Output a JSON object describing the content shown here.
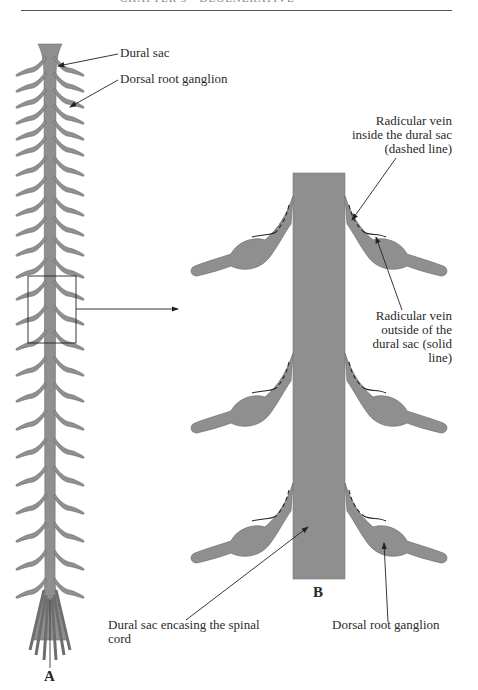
{
  "page": {
    "header_text": "CHAPTER 5 · DEGENERATIVE"
  },
  "panel_a": {
    "letter": "A",
    "labels": {
      "dural_sac": "Dural sac",
      "dorsal_root_ganglion": "Dorsal root ganglion"
    }
  },
  "panel_b": {
    "letter": "B",
    "labels": {
      "radicular_inside_1": "Radicular vein",
      "radicular_inside_2": "inside the dural sac",
      "radicular_inside_3": "(dashed line)",
      "radicular_outside_1": "Radicular vein",
      "radicular_outside_2": "outside of the",
      "radicular_outside_3": "dural sac (solid",
      "radicular_outside_4": "line)",
      "dural_sac_cord_1": "Dural sac encasing the spinal",
      "dural_sac_cord_2": "cord",
      "dorsal_root_ganglion": "Dorsal root ganglion"
    }
  },
  "colors": {
    "tissue_fill": "#8f8f8f",
    "tissue_stroke": "#6e6e6e",
    "line": "#222222",
    "text": "#2a2a2a"
  }
}
